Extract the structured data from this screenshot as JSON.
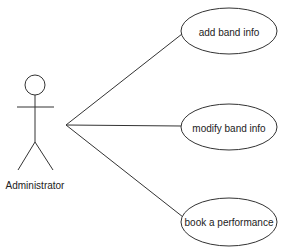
{
  "diagram": {
    "type": "use-case",
    "actor": {
      "label": "Administrator"
    },
    "use_cases": [
      {
        "label": "add band info"
      },
      {
        "label": "modify band info"
      },
      {
        "label": "book a performance"
      }
    ],
    "colors": {
      "stroke": "#333333",
      "background": "#ffffff",
      "text": "#222222"
    }
  }
}
